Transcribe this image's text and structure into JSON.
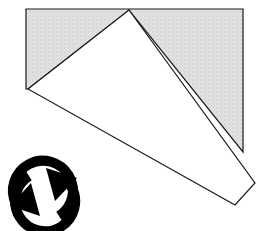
{
  "canvas": {
    "width": 259,
    "height": 231,
    "background_color": "#ffffff"
  },
  "colors": {
    "shaded_fill": "#dedede",
    "white_fill": "#ffffff",
    "outline_stroke": "#1a1a1a",
    "icon_fill": "#000000"
  },
  "shapes": {
    "shaded_region": {
      "label": "shaded-region",
      "fill": "#dedede",
      "stroke": "#1a1a1a",
      "stroke_width": 1.2,
      "points": "26,9 243,9 243,152 129,10 28,89 26,89",
      "vertices": [
        {
          "name": "rect-top-left",
          "x": 26,
          "y": 9
        },
        {
          "name": "rect-top-right",
          "x": 243,
          "y": 9
        },
        {
          "name": "rect-bottom-right",
          "x": 243,
          "y": 152
        },
        {
          "name": "kite-apex",
          "x": 129,
          "y": 10
        },
        {
          "name": "kite-left",
          "x": 28,
          "y": 89
        },
        {
          "name": "rect-bottom-left",
          "x": 26,
          "y": 89
        }
      ]
    },
    "white_quadrilateral": {
      "label": "white-kite",
      "fill": "#ffffff",
      "stroke": "#1a1a1a",
      "stroke_width": 1.2,
      "points": "129,10 255,183 235,205 28,89",
      "vertices": [
        {
          "name": "kite-apex",
          "x": 129,
          "y": 10
        },
        {
          "name": "kite-right",
          "x": 255,
          "y": 183
        },
        {
          "name": "kite-bottom",
          "x": 235,
          "y": 205
        },
        {
          "name": "kite-left",
          "x": 28,
          "y": 89
        }
      ]
    }
  },
  "rotation_icon": {
    "label": "rotation-icon",
    "semantic": "rotate-clockwise-icon",
    "fill": "#000000",
    "center": {
      "x": 43,
      "y": 192
    },
    "outer_radius": 33,
    "ring_thickness": 9,
    "direction": "clockwise",
    "arrowhead_count": 2
  }
}
